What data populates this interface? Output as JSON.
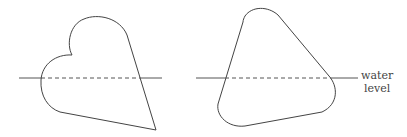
{
  "diagram": {
    "figures": [
      {
        "name": "heart-shaped floating body"
      },
      {
        "name": "rounded-triangle floating body"
      }
    ],
    "water_level_label": {
      "line1": "water",
      "line2": "level"
    },
    "colors": {
      "stroke": "#444444",
      "background": "#ffffff"
    }
  }
}
